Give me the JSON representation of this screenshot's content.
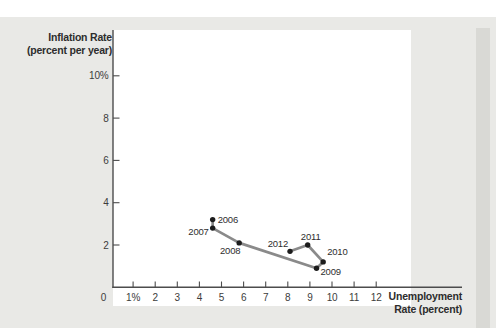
{
  "figure": {
    "page_bg": "#ffffff",
    "card_bg": "#e9e9e6",
    "shadow_color": "#d9d9d5",
    "plot_bg": "#ffffff"
  },
  "chart_data": {
    "type": "line",
    "title": "",
    "ylabel": "Inflation Rate (percent per year)",
    "ylabel_lines": [
      "Inflation Rate",
      "(percent per year)"
    ],
    "xlabel": "Unemployment Rate (percent)",
    "xlabel_lines": [
      "Unemployment",
      "Rate (percent)"
    ],
    "origin_tick_label": "0",
    "xlim": [
      0,
      12.7
    ],
    "ylim": [
      0,
      12.2
    ],
    "grid": false,
    "x_ticks": [
      {
        "value": 1,
        "label": "1%"
      },
      {
        "value": 2,
        "label": "2"
      },
      {
        "value": 3,
        "label": "3"
      },
      {
        "value": 4,
        "label": "4"
      },
      {
        "value": 5,
        "label": "5"
      },
      {
        "value": 6,
        "label": "6"
      },
      {
        "value": 7,
        "label": "7"
      },
      {
        "value": 8,
        "label": "8"
      },
      {
        "value": 9,
        "label": "9"
      },
      {
        "value": 10,
        "label": "10"
      },
      {
        "value": 11,
        "label": "11"
      },
      {
        "value": 12,
        "label": "12"
      }
    ],
    "y_ticks": [
      {
        "value": 2,
        "label": "2"
      },
      {
        "value": 4,
        "label": "4"
      },
      {
        "value": 6,
        "label": "6"
      },
      {
        "value": 8,
        "label": "8"
      },
      {
        "value": 10,
        "label": "10%"
      }
    ],
    "points": [
      {
        "year": "2006",
        "x": 4.6,
        "y": 3.2,
        "label_anchor": "start",
        "label_dx": 5,
        "label_dy": 0
      },
      {
        "year": "2007",
        "x": 4.6,
        "y": 2.8,
        "label_anchor": "end",
        "label_dx": -4,
        "label_dy": 3
      },
      {
        "year": "2008",
        "x": 5.8,
        "y": 2.1,
        "label_anchor": "middle",
        "label_dx": -9,
        "label_dy": 8
      },
      {
        "year": "2009",
        "x": 9.3,
        "y": 0.9,
        "label_anchor": "start",
        "label_dx": 4,
        "label_dy": 3
      },
      {
        "year": "2010",
        "x": 9.6,
        "y": 1.2,
        "label_anchor": "start",
        "label_dx": 4,
        "label_dy": -10
      },
      {
        "year": "2011",
        "x": 8.9,
        "y": 2.0,
        "label_anchor": "middle",
        "label_dx": 3,
        "label_dy": -9
      },
      {
        "year": "2012",
        "x": 8.1,
        "y": 1.7,
        "label_anchor": "end",
        "label_dx": -2,
        "label_dy": -8
      }
    ],
    "line_color": "#8a8a8a",
    "point_color": "#1c1c1c",
    "axis_color": "#4c4c4c",
    "tick_text_color": "#3c3c3c",
    "year_label_color": "#2e2e2e"
  }
}
